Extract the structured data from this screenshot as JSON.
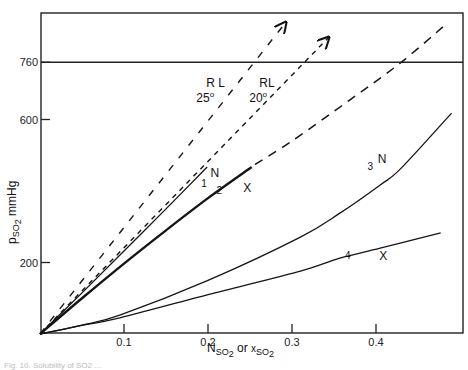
{
  "chart_data": {
    "type": "line",
    "title": "",
    "xlabel": "N_SO2 or x_SO2",
    "ylabel": "p_SO2 mmHg",
    "xlim": [
      0,
      0.5
    ],
    "ylim": [
      0,
      900
    ],
    "grid": false,
    "legend": "none (inline curve labels)",
    "x_ticks": [
      {
        "value": 0.1,
        "label": "0.1"
      },
      {
        "value": 0.2,
        "label": "0.2"
      },
      {
        "value": 0.3,
        "label": "0.3"
      },
      {
        "value": 0.4,
        "label": "0.4"
      }
    ],
    "y_ticks": [
      {
        "value": 200,
        "label": "200"
      },
      {
        "value": 600,
        "label": "600"
      },
      {
        "value": 760,
        "label": "760"
      }
    ],
    "reference_lines": [
      {
        "axis": "y",
        "value": 760,
        "label": "760",
        "style": "solid"
      }
    ],
    "series": [
      {
        "name": "RL 25°",
        "label_top": "R L",
        "label_bottom": "25",
        "degree": "o",
        "style": "dashed-long",
        "arrow": true,
        "points": [
          [
            0,
            0
          ],
          [
            0.292,
            870
          ]
        ],
        "label_pos": [
          0.198,
          690
        ]
      },
      {
        "name": "RL 20°",
        "label_top": "RL",
        "label_bottom": "20",
        "degree": "o",
        "style": "dashed-dense",
        "arrow": true,
        "points": [
          [
            0,
            0
          ],
          [
            0.343,
            828
          ]
        ],
        "label_pos": [
          0.261,
          690
        ]
      },
      {
        "name": "1 N",
        "number": "1",
        "tag": "N",
        "style": "solid-thin",
        "points": [
          [
            0,
            0
          ],
          [
            0.05,
            115
          ],
          [
            0.1,
            232
          ],
          [
            0.15,
            350
          ],
          [
            0.199,
            467
          ]
        ],
        "number_pos": [
          0.192,
          410
        ],
        "tag_pos": [
          0.203,
          438
        ]
      },
      {
        "name": "2 X",
        "number": "2",
        "tag": "X",
        "style": "solid-thick",
        "points": [
          [
            0,
            0
          ],
          [
            0.05,
            100
          ],
          [
            0.1,
            197
          ],
          [
            0.15,
            290
          ],
          [
            0.2,
            380
          ],
          [
            0.252,
            467
          ]
        ],
        "number_pos": [
          0.21,
          392
        ],
        "tag_pos": [
          0.242,
          398
        ]
      },
      {
        "name": "2 X (extrapolated)",
        "style": "dashed-medium",
        "points": [
          [
            0.256,
            474
          ],
          [
            0.3,
            540
          ],
          [
            0.369,
            655
          ],
          [
            0.43,
            760
          ],
          [
            0.482,
            864
          ]
        ]
      },
      {
        "name": "3 N",
        "number": "3",
        "tag": "N",
        "style": "solid-thin",
        "points": [
          [
            0,
            0
          ],
          [
            0.05,
            25
          ],
          [
            0.095,
            53
          ],
          [
            0.2,
            150
          ],
          [
            0.31,
            271
          ],
          [
            0.357,
            338
          ],
          [
            0.405,
            417
          ],
          [
            0.43,
            464
          ],
          [
            0.49,
            618
          ]
        ],
        "number_pos": [
          0.39,
          460
        ],
        "tag_pos": [
          0.402,
          478
        ]
      },
      {
        "name": "4 X",
        "number": "4",
        "tag": "X",
        "style": "solid-thin",
        "points": [
          [
            0,
            0
          ],
          [
            0.05,
            24
          ],
          [
            0.095,
            45
          ],
          [
            0.2,
            110
          ],
          [
            0.31,
            176
          ],
          [
            0.357,
            212
          ],
          [
            0.405,
            240
          ],
          [
            0.477,
            283
          ]
        ],
        "number_pos": [
          0.363,
          210
        ],
        "tag_pos": [
          0.404,
          208
        ]
      }
    ],
    "annotations": [
      "R L 25°",
      "RL 20°",
      "1",
      "N",
      "2",
      "X",
      "3",
      "N",
      "4",
      "X"
    ]
  },
  "axis_text": {
    "x_title_main": "N",
    "x_title_sub1": "SO",
    "x_title_sub1b": "2",
    "x_title_or": " or ",
    "x_title_x": "x",
    "x_title_sub2": "SO",
    "x_title_sub2b": "2",
    "y_title_main": "p",
    "y_title_sub": "SO",
    "y_title_subb": "2",
    "y_title_unit": " mmHg"
  },
  "caption": "Fig. 10. Solubility of SO2 ..."
}
